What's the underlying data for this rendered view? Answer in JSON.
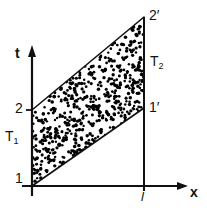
{
  "figure": {
    "width": 207,
    "height": 216,
    "background_color": "#ffffff",
    "line_color": "#111111",
    "stipple_color": "#000000"
  },
  "axes": {
    "x_axis": {
      "label": "x",
      "name": "x-axis",
      "origin_px": [
        32,
        186
      ],
      "end_px": [
        188,
        186
      ],
      "arrow": true
    },
    "y_axis": {
      "label": "t",
      "name": "t-axis",
      "origin_px": [
        32,
        186
      ],
      "end_px": [
        32,
        46
      ],
      "arrow": true
    }
  },
  "ticks": {
    "t_axis": [
      {
        "label": "1",
        "y_px": 186
      },
      {
        "label": "2",
        "y_px": 110
      }
    ],
    "x_axis": [
      {
        "label": "l",
        "x_px": 144
      }
    ]
  },
  "vertices": [
    {
      "name": "point-1",
      "label": "1",
      "x_px": 32,
      "y_px": 186
    },
    {
      "name": "point-2",
      "label": "2",
      "x_px": 32,
      "y_px": 110
    },
    {
      "name": "point-2-prime",
      "label": "2′",
      "x_px": 144,
      "y_px": 17
    },
    {
      "name": "point-1-prime",
      "label": "1′",
      "x_px": 144,
      "y_px": 108
    }
  ],
  "region_labels": {
    "lower": {
      "base": "T",
      "sub": "1",
      "full": "T₁"
    },
    "upper": {
      "base": "T",
      "sub": "2",
      "full": "T₂"
    }
  },
  "stipple": {
    "dot_count": 560,
    "dot_radius_px": 1.45,
    "description": "dense random black dots filling the parallelogram 1-2-2'-1'"
  },
  "chart_data": {
    "type": "area",
    "title": "",
    "xlabel": "x",
    "ylabel": "t",
    "xlim": [
      0,
      1.4
    ],
    "ylim": [
      0,
      1.85
    ],
    "grid": false,
    "legend": null,
    "xticks": [
      {
        "value": 1.0,
        "label": "l"
      }
    ],
    "yticks": [
      {
        "value": 0.0,
        "label": "1"
      },
      {
        "value": 1.0,
        "label": "2"
      }
    ],
    "polygon": {
      "name": "shaded-parallelogram",
      "vertices_data": [
        {
          "label": "1",
          "x": 0.0,
          "t": 0.0
        },
        {
          "label": "2",
          "x": 0.0,
          "t": 1.0
        },
        {
          "label": "2′",
          "x": 1.0,
          "t": 2.22
        },
        {
          "label": "1′",
          "x": 1.0,
          "t": 1.03
        }
      ],
      "fill": "stipple",
      "annotations": [
        "T₁",
        "T₂"
      ]
    }
  }
}
